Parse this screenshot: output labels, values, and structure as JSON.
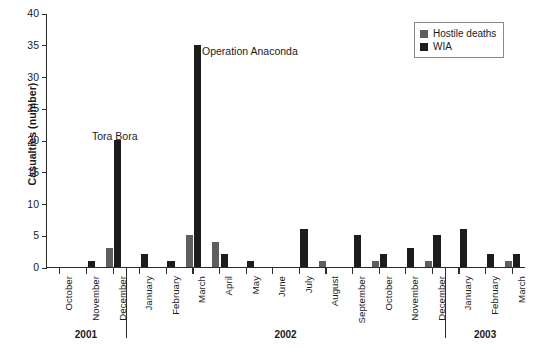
{
  "chart_data": {
    "type": "bar",
    "title": "",
    "xlabel": "",
    "ylabel": "Casualties (number)",
    "ylim": [
      0,
      40
    ],
    "yticks": [
      0,
      5,
      10,
      15,
      20,
      25,
      30,
      35,
      40
    ],
    "grid": false,
    "legend_position": "top-right",
    "categories": [
      "October",
      "November",
      "December",
      "January",
      "February",
      "March",
      "April",
      "May",
      "June",
      "July",
      "August",
      "September",
      "October",
      "November",
      "December",
      "January",
      "February",
      "March"
    ],
    "groups": [
      {
        "year": "2001",
        "months": [
          "October",
          "November",
          "December"
        ]
      },
      {
        "year": "2002",
        "months": [
          "January",
          "February",
          "March",
          "April",
          "May",
          "June",
          "July",
          "August",
          "September",
          "October",
          "November",
          "December"
        ]
      },
      {
        "year": "2003",
        "months": [
          "January",
          "February",
          "March"
        ]
      }
    ],
    "series": [
      {
        "name": "Hostile deaths",
        "color": "#5e5e5e",
        "values": [
          0,
          0,
          3,
          0,
          0,
          5,
          4,
          0,
          0,
          0,
          1,
          0,
          1,
          0,
          1,
          0,
          0,
          1
        ]
      },
      {
        "name": "WIA",
        "color": "#1c1c1c",
        "values": [
          0,
          1,
          20,
          2,
          1,
          35,
          2,
          1,
          0,
          6,
          0,
          5,
          2,
          3,
          5,
          6,
          2,
          2
        ]
      }
    ],
    "annotations": [
      {
        "text": "Tora Bora",
        "x": 92,
        "y": 130
      },
      {
        "text": "Operation Anaconda",
        "x": 202,
        "y": 45
      }
    ]
  }
}
